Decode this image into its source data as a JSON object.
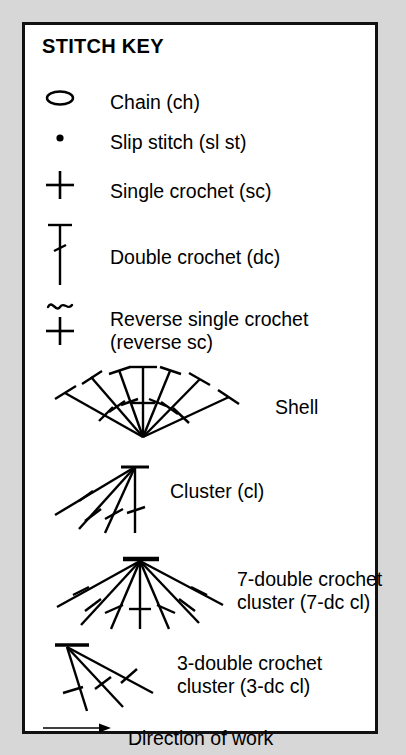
{
  "panel": {
    "title": "STITCH KEY",
    "background": "#ffffff",
    "border_color": "#111111",
    "page_background": "#d7d7d7",
    "ink": "#000000"
  },
  "rows": [
    {
      "id": "chain",
      "symbol": "chain-oval-symbol",
      "label": "Chain (ch)",
      "label_x": 85,
      "label_y": 66
    },
    {
      "id": "slip-stitch",
      "symbol": "slip-stitch-dot-symbol",
      "label": "Slip stitch (sl st)",
      "label_x": 85,
      "label_y": 106
    },
    {
      "id": "single-crochet",
      "symbol": "single-crochet-plus-symbol",
      "label": "Single crochet (sc)",
      "label_x": 85,
      "label_y": 155
    },
    {
      "id": "double-crochet",
      "symbol": "double-crochet-symbol",
      "label": "Double crochet (dc)",
      "label_x": 85,
      "label_y": 221
    },
    {
      "id": "reverse-single-crochet",
      "symbol": "reverse-single-crochet-symbol",
      "label": "Reverse single crochet\n(reverse sc)",
      "label_x": 85,
      "label_y": 283
    },
    {
      "id": "shell",
      "symbol": "shell-fan-symbol",
      "label": "Shell",
      "label_x": 250,
      "label_y": 371
    },
    {
      "id": "cluster",
      "symbol": "cluster-symbol",
      "label": "Cluster (cl)",
      "label_x": 145,
      "label_y": 455
    },
    {
      "id": "seven-dc-cluster",
      "symbol": "seven-dc-cluster-symbol",
      "label": "7-double crochet\ncluster (7-dc cl)",
      "label_x": 212,
      "label_y": 543
    },
    {
      "id": "three-dc-cluster",
      "symbol": "three-dc-cluster-symbol",
      "label": "3-double crochet\ncluster (3-dc cl)",
      "label_x": 152,
      "label_y": 627
    },
    {
      "id": "direction-of-work",
      "symbol": "direction-arrow-symbol",
      "label": "Direction of work",
      "label_x": 103,
      "label_y": 702
    }
  ]
}
